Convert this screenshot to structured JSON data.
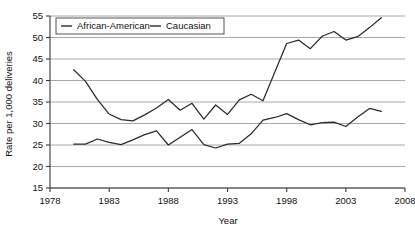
{
  "chart_data": {
    "type": "line",
    "title": "",
    "xlabel": "Year",
    "ylabel": "Rate per 1,000 deliveries",
    "xlim": [
      1978,
      2008
    ],
    "ylim": [
      15,
      55
    ],
    "xticks": [
      1978,
      1983,
      1988,
      1993,
      1998,
      2003,
      2008
    ],
    "yticks": [
      15,
      20,
      25,
      30,
      35,
      40,
      45,
      50,
      55
    ],
    "grid": true,
    "legend_position": "top-left",
    "x": [
      1980,
      1981,
      1982,
      1983,
      1984,
      1985,
      1986,
      1987,
      1988,
      1989,
      1990,
      1991,
      1992,
      1993,
      1994,
      1995,
      1996,
      1997,
      1998,
      1999,
      2000,
      2001,
      2002,
      2003,
      2004,
      2005,
      2006
    ],
    "series": [
      {
        "name": "African-American",
        "color": "#2b2b2b",
        "values": [
          42.5,
          39.8,
          35.6,
          32.2,
          30.9,
          30.6,
          32.0,
          33.6,
          35.6,
          33.1,
          34.7,
          31.0,
          34.3,
          32.1,
          35.5,
          36.8,
          35.3,
          42.0,
          48.6,
          49.4,
          47.4,
          50.3,
          51.4,
          49.4,
          50.2,
          52.3,
          54.6
        ]
      },
      {
        "name": "Caucasian",
        "color": "#2b2b2b",
        "values": [
          25.2,
          25.2,
          26.4,
          25.6,
          25.1,
          26.2,
          27.4,
          28.3,
          25.0,
          26.8,
          28.6,
          25.1,
          24.3,
          25.2,
          25.4,
          27.6,
          30.8,
          31.4,
          32.3,
          30.9,
          29.7,
          30.2,
          30.3,
          29.3,
          31.5,
          33.5,
          32.8
        ]
      }
    ],
    "legend": [
      {
        "label": "African-American"
      },
      {
        "label": "Caucasian"
      }
    ],
    "tick_labels_x": [
      "1978",
      "1983",
      "1988",
      "1993",
      "1998",
      "2003",
      "2008"
    ],
    "tick_labels_y": [
      "15",
      "20",
      "25",
      "30",
      "35",
      "40",
      "45",
      "50",
      "55"
    ]
  }
}
